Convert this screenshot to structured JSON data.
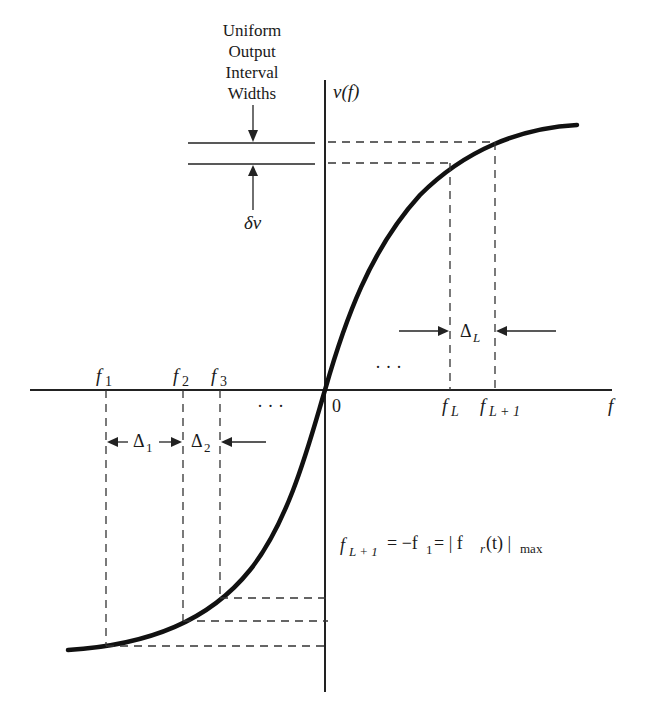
{
  "diagram": {
    "annotation_title": [
      "Uniform",
      "Output",
      "Interval",
      "Widths"
    ],
    "y_axis_label": "v(f)",
    "x_axis_label": "f",
    "origin_label": "0",
    "delta_v_label": "δv",
    "x_ticks": [
      {
        "base": "f",
        "sub": "1"
      },
      {
        "base": "f",
        "sub": "2"
      },
      {
        "base": "f",
        "sub": "3"
      },
      {
        "base": "f",
        "sub": "L"
      },
      {
        "base": "f",
        "sub": "L + 1"
      }
    ],
    "intervals": [
      {
        "base": "Δ",
        "sub": "1"
      },
      {
        "base": "Δ",
        "sub": "2"
      },
      {
        "base": "Δ",
        "sub": "L"
      }
    ],
    "ellipsis": "· · ·",
    "equation": {
      "lhs_base": "f",
      "lhs_sub": "L + 1",
      "mid": " = −f",
      "mid_sub": "1",
      "rhs": " = | f",
      "rhs_sub": "r",
      "rhs_tail": "(t) |",
      "rhs_max": "max"
    },
    "curve_color": "#111111",
    "line_color": "#222222"
  }
}
